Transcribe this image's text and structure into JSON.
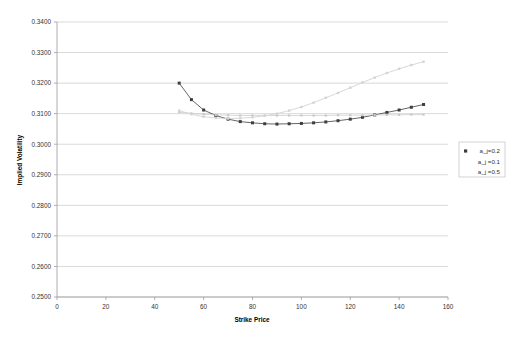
{
  "chart_data": {
    "type": "line",
    "title": "",
    "xlabel": "Strike Price",
    "ylabel": "Implied Volatility",
    "xlim": [
      0,
      160
    ],
    "ylim": [
      0.25,
      0.34
    ],
    "xticks": [
      0,
      20,
      40,
      60,
      80,
      100,
      120,
      140,
      160
    ],
    "xtick_labels": [
      "0",
      "20",
      "40",
      "60",
      "80",
      "100",
      "120",
      "140",
      "160"
    ],
    "yticks": [
      0.25,
      0.26,
      0.27,
      0.28,
      0.29,
      0.3,
      0.31,
      0.32,
      0.33,
      0.34
    ],
    "ytick_labels": [
      "0.2500",
      "0.2600",
      "0.2700",
      "0.2800",
      "0.2900",
      "0.3000",
      "0.3100",
      "0.3200",
      "0.3300",
      "0.3400"
    ],
    "grid": "horizontal",
    "legend_position": "right",
    "series": [
      {
        "name": "a_j=0.2",
        "color": "#3d3d3d",
        "marker": "square",
        "marker_size": 3.0,
        "line_width": 0.8,
        "x": [
          50,
          55,
          60,
          65,
          70,
          75,
          80,
          85,
          90,
          95,
          100,
          105,
          110,
          115,
          120,
          125,
          130,
          135,
          140,
          145,
          150
        ],
        "y": [
          0.32,
          0.3146,
          0.3112,
          0.3094,
          0.3082,
          0.3074,
          0.307,
          0.3067,
          0.3066,
          0.3067,
          0.3068,
          0.307,
          0.3073,
          0.3077,
          0.3082,
          0.3088,
          0.3096,
          0.3104,
          0.3112,
          0.3121,
          0.313
        ]
      },
      {
        "name": "a_j =0.1",
        "color": "#c9c9c9",
        "marker": "square",
        "marker_size": 2.2,
        "line_width": 0.7,
        "x": [
          50,
          55,
          60,
          65,
          70,
          75,
          80,
          85,
          90,
          95,
          100,
          105,
          110,
          115,
          120,
          125,
          130,
          135,
          140,
          145,
          150
        ],
        "y": [
          0.3105,
          0.3101,
          0.3098,
          0.3096,
          0.3095,
          0.3094,
          0.3094,
          0.3094,
          0.3094,
          0.3094,
          0.3094,
          0.3094,
          0.3094,
          0.3095,
          0.3095,
          0.3095,
          0.3096,
          0.3096,
          0.3096,
          0.3097,
          0.3097
        ]
      },
      {
        "name": "a_j =0.5",
        "color": "#d4d4d4",
        "marker": "square",
        "marker_size": 2.4,
        "line_width": 0.9,
        "x": [
          50,
          55,
          60,
          65,
          70,
          75,
          80,
          85,
          90,
          95,
          100,
          105,
          110,
          115,
          120,
          125,
          130,
          135,
          140,
          145,
          150
        ],
        "y": [
          0.311,
          0.3098,
          0.309,
          0.3086,
          0.3084,
          0.3085,
          0.3088,
          0.3093,
          0.31,
          0.311,
          0.3122,
          0.3136,
          0.3152,
          0.3168,
          0.3185,
          0.3202,
          0.3218,
          0.3233,
          0.3247,
          0.3259,
          0.327
        ]
      }
    ]
  },
  "legend": {
    "entries": [
      {
        "label": "a_j=0.2",
        "color": "#3d3d3d",
        "show_marker": true
      },
      {
        "label": "a_j =0.1",
        "color": "#c9c9c9",
        "show_marker": false
      },
      {
        "label": "a_j =0.5",
        "color": "#d4d4d4",
        "show_marker": false
      }
    ]
  },
  "axes": {
    "x_title": "Strike Price",
    "y_title": "Implied Volatility"
  }
}
